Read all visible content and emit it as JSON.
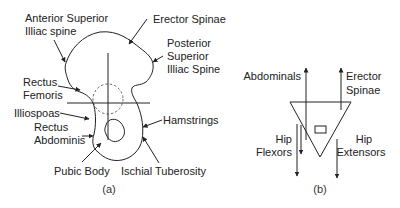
{
  "panel_a": {
    "caption": "(a)",
    "labels": {
      "asis_line1": "Anterior Superior",
      "asis_line2": "Illiac spine",
      "erector_spinae": "Erector Spinae",
      "psis_line1": "Posterior",
      "psis_line2": "Superior",
      "psis_line3": "Illiac Spine",
      "rectus_femoris_line1": "Rectus",
      "rectus_femoris_line2": "Femoris",
      "illiospoas": "Illiospoas",
      "rectus_abdominis_line1": "Rectus",
      "rectus_abdominis_line2": "Abdominis",
      "hamstrings": "Hamstrings",
      "pubic_body": "Pubic Body",
      "ischial_tuberosity": "Ischial Tuberosity"
    }
  },
  "panel_b": {
    "caption": "(b)",
    "labels": {
      "abdominals": "Abdominals",
      "erector_line1": "Erector",
      "erector_line2": "Spinae",
      "hip_flexors_line1": "Hip",
      "hip_flexors_line2": "Flexors",
      "hip_extensors_line1": "Hip",
      "hip_extensors_line2": "Extensors"
    }
  },
  "colors": {
    "line": "#222222",
    "background": "#ffffff"
  }
}
